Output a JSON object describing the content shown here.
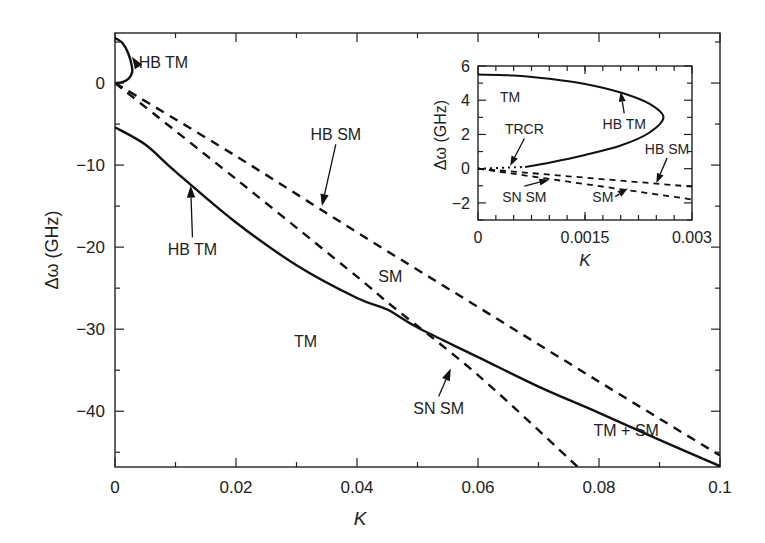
{
  "chart_data": [
    {
      "id": "main",
      "type": "line",
      "title": "",
      "xlabel": "K",
      "ylabel": "Δω (GHz)",
      "xlim": [
        0,
        0.1
      ],
      "ylim": [
        -46.8,
        6.1
      ],
      "grid": false,
      "legend": null,
      "x_ticks": [
        0,
        0.02,
        0.04,
        0.06,
        0.08,
        0.1
      ],
      "x_tick_labels": [
        "0",
        "0.02",
        "0.04",
        "0.06",
        "0.08",
        "0.1"
      ],
      "x_minor_ticks": [
        0.01,
        0.03,
        0.05,
        0.07,
        0.09
      ],
      "y_ticks": [
        0,
        -10,
        -20,
        -30,
        -40
      ],
      "y_tick_labels": [
        "0",
        "−10",
        "−20",
        "−30",
        "−40"
      ],
      "y_minor_ticks": [
        5,
        -5,
        -15,
        -25,
        -35,
        -45
      ],
      "series": [
        {
          "name": "HB TM (upper loop)",
          "style": "solid",
          "x": [
            0,
            0.0012,
            0.0022,
            0.0028,
            0.0028,
            0.0022,
            0.0012,
            0
          ],
          "y": [
            5.5,
            4.9,
            3.6,
            2.0,
            1.2,
            0.5,
            0.1,
            0
          ]
        },
        {
          "name": "HB TM",
          "style": "solid",
          "x": [
            0,
            0.005,
            0.01,
            0.02,
            0.03,
            0.04,
            0.045,
            0.05,
            0.06,
            0.07,
            0.08,
            0.09,
            0.1
          ],
          "y": [
            -5.4,
            -7.5,
            -10.8,
            -17.0,
            -22.2,
            -26.2,
            -27.6,
            -29.8,
            -33.4,
            -37.0,
            -40.2,
            -43.5,
            -46.7
          ]
        },
        {
          "name": "HB SM",
          "style": "dashed",
          "x": [
            0,
            0.02,
            0.04,
            0.06,
            0.08,
            0.1
          ],
          "y": [
            0,
            -8.9,
            -18.2,
            -27.3,
            -36.4,
            -45.4
          ]
        },
        {
          "name": "SN SM",
          "style": "dashed",
          "x": [
            0,
            0.02,
            0.04,
            0.0455,
            0.06,
            0.0765
          ],
          "y": [
            0,
            -11.7,
            -23.6,
            -27.0,
            -35.6,
            -46.8
          ]
        }
      ],
      "annotations": [
        {
          "text": "HB TM",
          "x": 0.008,
          "y": 1.8,
          "arrow_to": [
            0.0028,
            3.2
          ]
        },
        {
          "text": "HB SM",
          "x": 0.0365,
          "y": -7.0,
          "arrow_to": [
            0.0342,
            -15.0
          ]
        },
        {
          "text": "HB TM",
          "x": 0.0128,
          "y": -21.0,
          "arrow_to": [
            0.0125,
            -12.5
          ]
        },
        {
          "text": "SM",
          "x": 0.0455,
          "y": -24.2,
          "arrow_to": null
        },
        {
          "text": "TM",
          "x": 0.0315,
          "y": -32.2,
          "arrow_to": null
        },
        {
          "text": "SN SM",
          "x": 0.0535,
          "y": -40.4,
          "arrow_to": [
            0.0555,
            -34.8
          ]
        },
        {
          "text": "TM + SM",
          "x": 0.0845,
          "y": -43.0,
          "arrow_to": null
        }
      ]
    },
    {
      "id": "inset",
      "type": "line",
      "title": "",
      "xlabel": "K",
      "ylabel": "Δω (GHz)",
      "xlim": [
        0,
        0.003
      ],
      "ylim": [
        -3,
        6
      ],
      "grid": false,
      "x_ticks": [
        0,
        0.0015,
        0.003
      ],
      "x_tick_labels": [
        "0",
        "0.0015",
        "0.003"
      ],
      "x_minor_step": 0.00025,
      "y_ticks": [
        6,
        4,
        2,
        0,
        -2
      ],
      "y_tick_labels": [
        "6",
        "4",
        "2",
        "0",
        "−2"
      ],
      "y_minor_ticks": [
        5,
        3,
        1,
        -1,
        -3
      ],
      "series": [
        {
          "name": "HB TM",
          "style": "solid",
          "x": [
            0,
            0.0005,
            0.001,
            0.0015,
            0.002,
            0.0024,
            0.0026,
            0.0024,
            0.002,
            0.0015,
            0.001,
            0.00066
          ],
          "y": [
            5.5,
            5.45,
            5.25,
            4.95,
            4.45,
            3.8,
            3.0,
            2.1,
            1.35,
            0.8,
            0.35,
            0.1
          ]
        },
        {
          "name": "TRCR",
          "style": "dotted",
          "x": [
            0,
            0.00066
          ],
          "y": [
            0,
            0.1
          ]
        },
        {
          "name": "HB SM",
          "style": "dashed",
          "x": [
            0,
            0.003
          ],
          "y": [
            0,
            -1.05
          ]
        },
        {
          "name": "SN SM",
          "style": "dashed",
          "x": [
            0,
            0.003
          ],
          "y": [
            0,
            -1.8
          ]
        }
      ],
      "annotations": [
        {
          "text": "TM",
          "x": 0.00045,
          "y": 3.9,
          "arrow_to": null
        },
        {
          "text": "TRCR",
          "x": 0.00065,
          "y": 2.0,
          "arrow_to": [
            0.00045,
            0.15
          ]
        },
        {
          "text": "HB TM",
          "x": 0.00205,
          "y": 2.3,
          "arrow_to": [
            0.002,
            4.5
          ]
        },
        {
          "text": "HB SM",
          "x": 0.00265,
          "y": 0.85,
          "arrow_to": [
            0.0025,
            -0.85
          ]
        },
        {
          "text": "SN SM",
          "x": 0.00065,
          "y": -1.95,
          "arrow_to": [
            0.001,
            -0.65
          ]
        },
        {
          "text": "SM",
          "x": 0.00175,
          "y": -1.95,
          "arrow_to": [
            0.0021,
            -1.15
          ]
        }
      ]
    }
  ],
  "labels": {
    "main_xlabel": "K",
    "main_ylabel": "Δω (GHz)",
    "inset_xlabel": "K",
    "inset_ylabel": "Δω (GHz)"
  }
}
